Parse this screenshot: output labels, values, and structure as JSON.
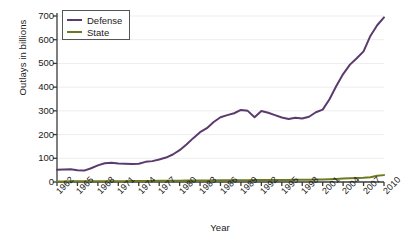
{
  "chart_data": {
    "type": "line",
    "title": "",
    "xlabel": "Year",
    "ylabel": "Outlays in billions",
    "xlim": [
      1962,
      2010
    ],
    "ylim": [
      0,
      700
    ],
    "grid": true,
    "legend_position": "upper-left",
    "ytick_labels": [
      "0",
      "100",
      "200",
      "300",
      "400",
      "500",
      "600",
      "700"
    ],
    "ytick_values": [
      0,
      100,
      200,
      300,
      400,
      500,
      600,
      700
    ],
    "xtick_labels": [
      "1962",
      "1965",
      "1968",
      "1971",
      "1974",
      "1977",
      "1980",
      "1983",
      "1986",
      "1989",
      "1992",
      "1995",
      "1998",
      "2001",
      "2004",
      "2007",
      "2010"
    ],
    "xtick_values": [
      1962,
      1965,
      1968,
      1971,
      1974,
      1977,
      1980,
      1983,
      1986,
      1989,
      1992,
      1995,
      1998,
      2001,
      2004,
      2007,
      2010
    ],
    "x": [
      1962,
      1963,
      1964,
      1965,
      1966,
      1967,
      1968,
      1969,
      1970,
      1971,
      1972,
      1973,
      1974,
      1975,
      1976,
      1977,
      1978,
      1979,
      1980,
      1981,
      1982,
      1983,
      1984,
      1985,
      1986,
      1987,
      1988,
      1989,
      1990,
      1991,
      1992,
      1993,
      1994,
      1995,
      1996,
      1997,
      1998,
      1999,
      2000,
      2001,
      2002,
      2003,
      2004,
      2005,
      2006,
      2007,
      2008,
      2009,
      2010
    ],
    "series": [
      {
        "name": "Defense",
        "color": "#5b3a6e",
        "values": [
          52,
          53,
          54,
          50,
          48,
          58,
          70,
          79,
          81,
          78,
          77,
          76,
          77,
          85,
          88,
          95,
          103,
          116,
          134,
          158,
          185,
          210,
          227,
          253,
          273,
          282,
          290,
          304,
          300,
          273,
          299,
          292,
          282,
          272,
          266,
          271,
          268,
          275,
          294,
          305,
          349,
          405,
          455,
          495,
          522,
          551,
          616,
          661,
          694
        ]
      },
      {
        "name": "State",
        "color": "#6b7a1f",
        "values": [
          2.5,
          2.6,
          2.7,
          2.7,
          2.8,
          2.9,
          3.0,
          3.1,
          3.2,
          3.4,
          3.6,
          3.8,
          4.0,
          4.2,
          4.5,
          4.8,
          5.1,
          5.4,
          5.6,
          5.9,
          6.1,
          6.3,
          6.5,
          6.8,
          7.0,
          7.2,
          7.4,
          7.6,
          7.8,
          8.0,
          8.1,
          8.2,
          8.3,
          8.4,
          8.6,
          9.0,
          9.5,
          10.0,
          10.5,
          11.0,
          12.0,
          13.0,
          14.5,
          16.0,
          17.0,
          18.0,
          20.0,
          26.0,
          29.0
        ]
      }
    ]
  },
  "axis": {
    "line_color": "#3a3a3a",
    "grid_color": "#ededed"
  },
  "legend": {
    "entries": [
      {
        "label": "Defense"
      },
      {
        "label": "State"
      }
    ]
  }
}
